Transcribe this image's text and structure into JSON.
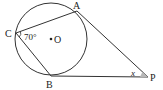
{
  "diagram": {
    "type": "geometry",
    "points": {
      "A": {
        "label": "A",
        "x": 77,
        "y": 10
      },
      "B": {
        "label": "B",
        "x": 51,
        "y": 77
      },
      "C": {
        "label": "C",
        "x": 16,
        "y": 33
      },
      "O": {
        "label": "O",
        "x": 51,
        "y": 39
      },
      "P": {
        "label": "P",
        "x": 147,
        "y": 77
      }
    },
    "circle": {
      "center": "O",
      "radius": 36
    },
    "segments": [
      "CA",
      "CB",
      "PA",
      "PB"
    ],
    "angles": {
      "C": {
        "label": "70°",
        "value": 70
      },
      "P": {
        "label": "x"
      }
    },
    "colors": {
      "stroke": "#333333",
      "angle_fill": "#b8b8b8"
    }
  }
}
